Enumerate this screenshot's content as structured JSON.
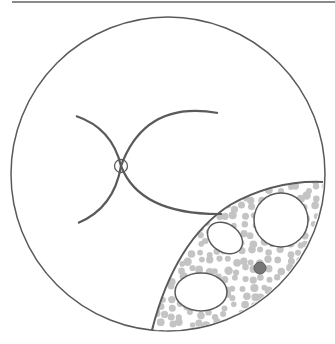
{
  "diagram": {
    "type": "schematic cell illustration",
    "colors": {
      "stroke": "#5a5a5a",
      "top_rule": "#8a8a8a",
      "granule": "#c4c4c4",
      "dark_dot": "#777777",
      "background": "#ffffff"
    },
    "outer_circle": {
      "cx": 168,
      "cy": 174,
      "r": 157
    },
    "crossing_arcs": [
      {
        "name": "arc-upper-left-to-lower-right"
      },
      {
        "name": "arc-lower-left-to-upper-right"
      }
    ],
    "crossing_marker": {
      "cx": 121,
      "cy": 166,
      "r": 6
    },
    "lens_region": {
      "contents": {
        "vesicles": [
          {
            "cx": 281,
            "cy": 220,
            "rx": 27,
            "ry": 27,
            "rot": 0
          },
          {
            "cx": 225,
            "cy": 238,
            "rx": 19,
            "ry": 14,
            "rot": 35
          },
          {
            "cx": 201,
            "cy": 292,
            "rx": 26,
            "ry": 19,
            "rot": 0
          }
        ],
        "dark_dot": {
          "cx": 260,
          "cy": 268,
          "r": 6
        }
      }
    }
  }
}
